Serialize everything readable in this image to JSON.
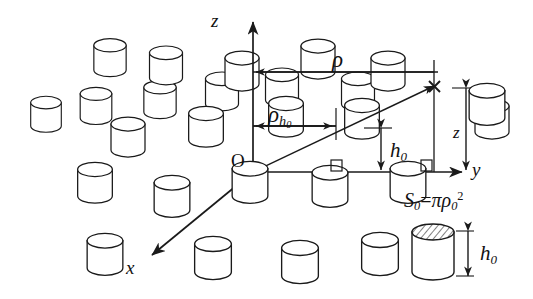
{
  "figure": {
    "background_color": "#ffffff",
    "line_color": "#1a1a1a",
    "width": 533,
    "height": 299
  },
  "axes": {
    "z_label": "z",
    "y_label": "y",
    "x_label": "x",
    "origin_label": "O"
  },
  "annotations": {
    "rho": "ρ",
    "rho_h0_base": "ρ",
    "rho_h0_sub": "h",
    "rho_h0_sub2": "0",
    "h0_base": "h",
    "h0_sub": "0",
    "z_dim": "z"
  },
  "legend": {
    "formula_s": "S",
    "formula_s_sub": "0",
    "formula_eq": "=",
    "formula_pi": "π",
    "formula_rho": "ρ",
    "formula_rho_sub": "0",
    "formula_rho_sup": "2",
    "height_base": "h",
    "height_sub": "0"
  },
  "geometry": {
    "origin": [
      253,
      172
    ],
    "z_axis_tip": [
      253,
      18
    ],
    "y_axis_tip": [
      466,
      172
    ],
    "x_axis_tip": [
      148,
      258
    ],
    "ray_tip": [
      434,
      86
    ],
    "rho_line_y": 72,
    "rho_h0_line_y": 126,
    "marker_cross": [
      434,
      86
    ]
  },
  "cylinder_count": 27
}
